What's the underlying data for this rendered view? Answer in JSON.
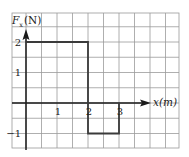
{
  "chart_data": {
    "type": "line",
    "subtype": "step",
    "title": "",
    "xlabel": "x(m)",
    "ylabel_main": "F",
    "ylabel_sub": "x",
    "ylabel_unit": "(N)",
    "ylabel": "Fx (N)",
    "x_ticks": [
      "1",
      "2",
      "3"
    ],
    "y_ticks": [
      "2",
      "1",
      "−1"
    ],
    "xlim": [
      -0.45,
      4.9
    ],
    "ylim": [
      -1.5,
      3.0
    ],
    "grid": true,
    "grid_step": 0.5,
    "legend": null,
    "series": [
      {
        "name": "Fx",
        "points": [
          [
            0,
            2
          ],
          [
            2,
            2
          ],
          [
            2,
            -1
          ],
          [
            3,
            -1
          ],
          [
            3,
            0
          ]
        ]
      }
    ],
    "segments": [
      {
        "x_start": 0,
        "x_end": 2,
        "value": 2
      },
      {
        "x_start": 2,
        "x_end": 3,
        "value": -1
      }
    ]
  }
}
